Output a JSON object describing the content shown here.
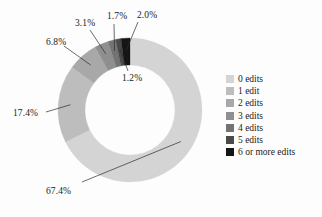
{
  "chart_data": {
    "type": "pie",
    "variant": "donut",
    "title": "",
    "subtitle": "",
    "xlabel": "",
    "ylabel": "",
    "grid": false,
    "legend_position": "right",
    "start_angle_deg": 0,
    "direction": "clockwise",
    "center": {
      "x": 130,
      "y": 110
    },
    "outer_radius": 72,
    "inner_radius": 45,
    "categories": [
      "0 edits",
      "1 edit",
      "2 edits",
      "3 edits",
      "4 edits",
      "5 edits",
      "6 or more edits"
    ],
    "values": [
      67.4,
      17.4,
      6.8,
      3.1,
      1.7,
      1.2,
      2.0
    ],
    "value_labels": [
      "67.4%",
      "17.4%",
      "6.8%",
      "3.1%",
      "1.7%",
      "1.2%",
      "2.0%"
    ],
    "colors": [
      "#d4d4d4",
      "#bdbdbd",
      "#a8a8a8",
      "#8f8f8f",
      "#737373",
      "#4a4a4a",
      "#151515"
    ],
    "units": "percent",
    "total": 99.6
  },
  "slices": [
    {
      "label": "0 edits",
      "value": 67.4,
      "value_label": "67.4%",
      "color": "#d4d4d4"
    },
    {
      "label": "1 edit",
      "value": 17.4,
      "value_label": "17.4%",
      "color": "#bdbdbd"
    },
    {
      "label": "2 edits",
      "value": 6.8,
      "value_label": "6.8%",
      "color": "#a8a8a8"
    },
    {
      "label": "3 edits",
      "value": 3.1,
      "value_label": "3.1%",
      "color": "#8f8f8f"
    },
    {
      "label": "4 edits",
      "value": 1.7,
      "value_label": "1.7%",
      "color": "#737373"
    },
    {
      "label": "5 edits",
      "value": 1.2,
      "value_label": "1.2%",
      "color": "#4a4a4a"
    },
    {
      "label": "6 or more edits",
      "value": 2.0,
      "value_label": "2.0%",
      "color": "#151515"
    }
  ],
  "legend": {
    "items": [
      {
        "label": "0 edits",
        "color": "#d4d4d4"
      },
      {
        "label": "1 edit",
        "color": "#bdbdbd"
      },
      {
        "label": "2 edits",
        "color": "#a8a8a8"
      },
      {
        "label": "3 edits",
        "color": "#8f8f8f"
      },
      {
        "label": "4 edits",
        "color": "#737373"
      },
      {
        "label": "5 edits",
        "color": "#4a4a4a"
      },
      {
        "label": "6 or more edits",
        "color": "#151515"
      }
    ]
  },
  "callouts": [
    {
      "name": "callout-67-4",
      "text": "67.4%",
      "x": 46,
      "y": 186
    },
    {
      "name": "callout-17-4",
      "text": "17.4%",
      "x": 13,
      "y": 108
    },
    {
      "name": "callout-6-8",
      "text": "6.8%",
      "x": 46,
      "y": 37
    },
    {
      "name": "callout-3-1",
      "text": "3.1%",
      "x": 75,
      "y": 18
    },
    {
      "name": "callout-1-7",
      "text": "1.7%",
      "x": 107,
      "y": 11
    },
    {
      "name": "callout-2-0",
      "text": "2.0%",
      "x": 137,
      "y": 10
    },
    {
      "name": "callout-1-2",
      "text": "1.2%",
      "x": 122,
      "y": 73
    }
  ],
  "background_color": "#fdfdfd",
  "text_color": "#1b1b1b"
}
